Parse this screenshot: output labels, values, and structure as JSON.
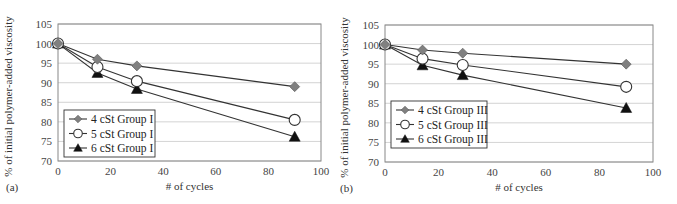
{
  "chart_data": [
    {
      "type": "line",
      "panel_label": "(a)",
      "title": "",
      "xlabel": "# of cycles",
      "ylabel": "% of initial polymer-added viscosity",
      "xlim": [
        0,
        100
      ],
      "ylim": [
        70,
        105
      ],
      "x_ticks": [
        "0",
        "20",
        "40",
        "60",
        "80",
        "100"
      ],
      "y_ticks": [
        "70",
        "75",
        "80",
        "85",
        "90",
        "95",
        "100",
        "105"
      ],
      "grid": "horizontal",
      "legend_position": "lower-left",
      "x": [
        0,
        15,
        30,
        90
      ],
      "series": [
        {
          "name": "4 cSt Group I",
          "marker": "diamond-gray",
          "values": [
            100,
            96,
            94.3,
            89
          ]
        },
        {
          "name": "5 cSt Group I",
          "marker": "circle-open",
          "values": [
            100,
            94,
            90.4,
            80.5
          ]
        },
        {
          "name": "6 cSt Group I",
          "marker": "triangle-black",
          "values": [
            100,
            92.5,
            88.4,
            76.2
          ]
        }
      ]
    },
    {
      "type": "line",
      "panel_label": "(b)",
      "title": "",
      "xlabel": "# of cycles",
      "ylabel": "% of initial polymer-added viscosity",
      "xlim": [
        0,
        100
      ],
      "ylim": [
        70,
        105
      ],
      "x_ticks": [
        "0",
        "20",
        "40",
        "60",
        "80",
        "100"
      ],
      "y_ticks": [
        "70",
        "75",
        "80",
        "85",
        "90",
        "95",
        "100",
        "105"
      ],
      "grid": "horizontal",
      "legend_position": "lower-left",
      "x": [
        0,
        14,
        29,
        90
      ],
      "series": [
        {
          "name": "4 cSt Group III",
          "marker": "diamond-gray",
          "values": [
            100,
            98.6,
            97.8,
            95
          ]
        },
        {
          "name": "5 cSt Group III",
          "marker": "circle-open",
          "values": [
            100,
            96.4,
            94.8,
            89.2
          ]
        },
        {
          "name": "6 cSt Group III",
          "marker": "triangle-black",
          "values": [
            100,
            94.7,
            92.2,
            83.8
          ]
        }
      ]
    }
  ],
  "colors": {
    "line": "#333333",
    "grid": "#c8c8c8",
    "frame": "#888888",
    "diamond": "#808080",
    "triangle": "#111111"
  }
}
